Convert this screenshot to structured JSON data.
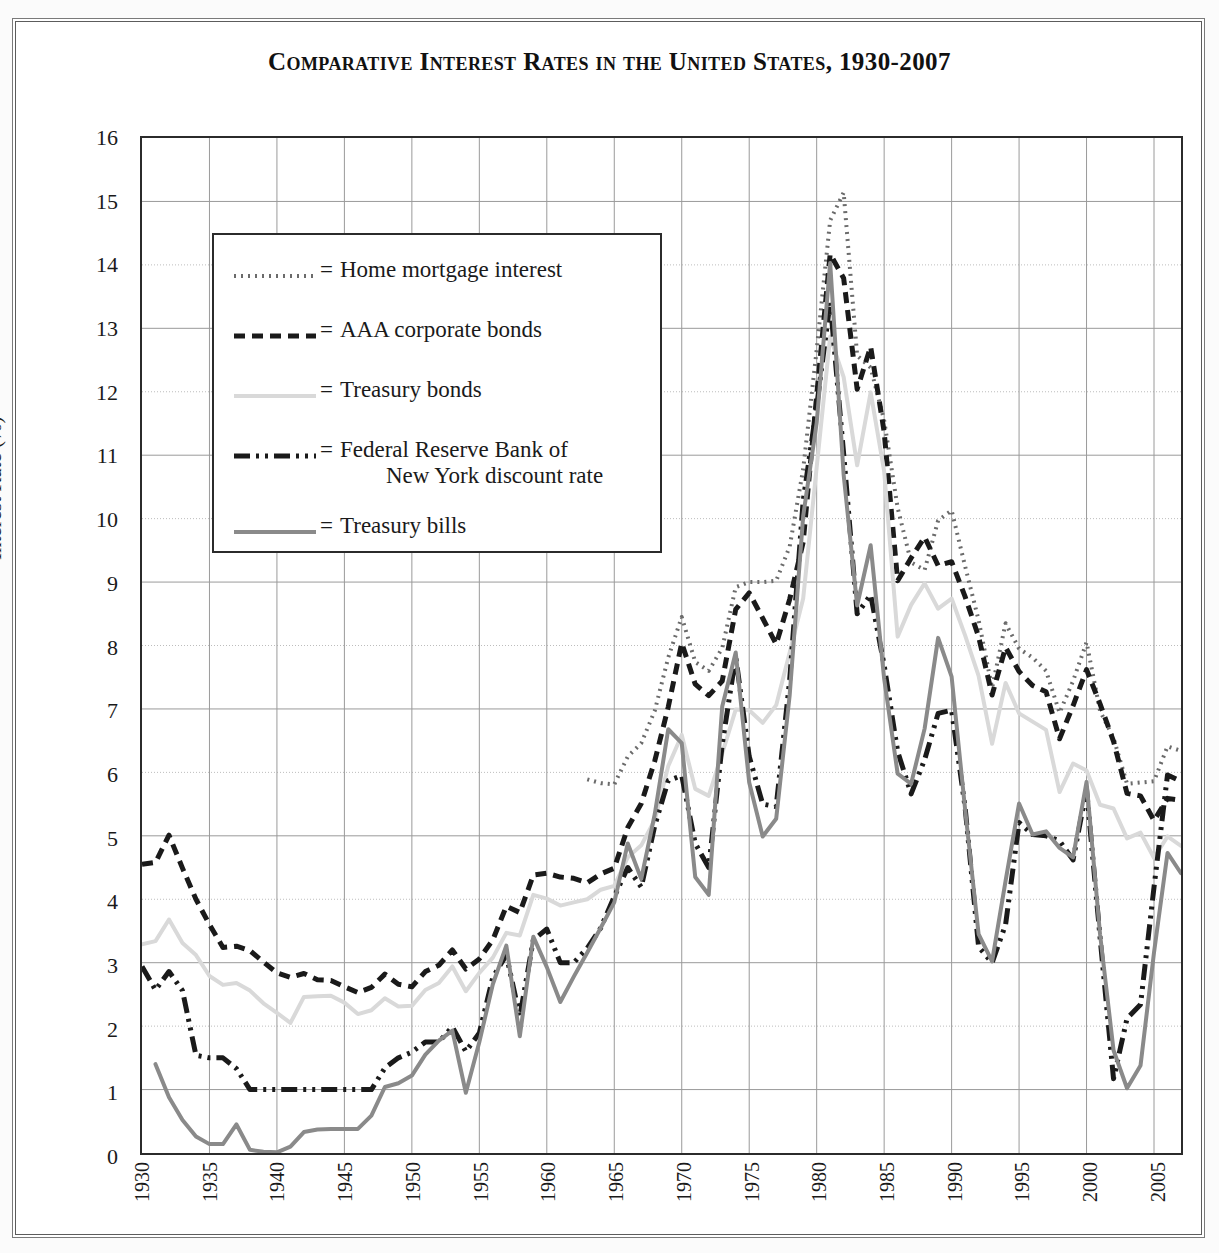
{
  "chart_data": {
    "type": "line",
    "title": "Comparative Interest Rates in the United States, 1930-2007",
    "xlabel": "",
    "ylabel": "Interest Rate (%)",
    "xlim": [
      1930,
      2007
    ],
    "ylim": [
      0,
      16
    ],
    "ytick_step": 1,
    "xtick_step": 5,
    "grid": true,
    "legend_position": "upper-left-inset",
    "x_tick_labels": [
      "1930",
      "1935",
      "1940",
      "1945",
      "1950",
      "1955",
      "1960",
      "1965",
      "1970",
      "1975",
      "1980",
      "1985",
      "1990",
      "1995",
      "2000",
      "2005"
    ],
    "y_tick_labels": [
      "0",
      "1",
      "2",
      "3",
      "4",
      "5",
      "6",
      "7",
      "8",
      "9",
      "10",
      "11",
      "12",
      "13",
      "14",
      "15",
      "16"
    ],
    "x": [
      1930,
      1931,
      1932,
      1933,
      1934,
      1935,
      1936,
      1937,
      1938,
      1939,
      1940,
      1941,
      1942,
      1943,
      1944,
      1945,
      1946,
      1947,
      1948,
      1949,
      1950,
      1951,
      1952,
      1953,
      1954,
      1955,
      1956,
      1957,
      1958,
      1959,
      1960,
      1961,
      1962,
      1963,
      1964,
      1965,
      1966,
      1967,
      1968,
      1969,
      1970,
      1971,
      1972,
      1973,
      1974,
      1975,
      1976,
      1977,
      1978,
      1979,
      1980,
      1981,
      1982,
      1983,
      1984,
      1985,
      1986,
      1987,
      1988,
      1989,
      1990,
      1991,
      1992,
      1993,
      1994,
      1995,
      1996,
      1997,
      1998,
      1999,
      2000,
      2001,
      2002,
      2003,
      2004,
      2005,
      2006,
      2007
    ],
    "series": [
      {
        "name": "Home mortgage interest",
        "style": "dotted",
        "color": "#6b6b6b",
        "x_start": 1963,
        "values": [
          null,
          null,
          null,
          null,
          null,
          null,
          null,
          null,
          null,
          null,
          null,
          null,
          null,
          null,
          null,
          null,
          null,
          null,
          null,
          null,
          null,
          null,
          null,
          null,
          null,
          null,
          null,
          null,
          null,
          null,
          null,
          null,
          null,
          5.89,
          5.83,
          5.81,
          6.25,
          6.46,
          6.97,
          7.81,
          8.45,
          7.74,
          7.6,
          7.96,
          8.92,
          9.0,
          9.0,
          9.02,
          9.56,
          10.78,
          12.66,
          14.7,
          15.14,
          12.57,
          12.38,
          11.55,
          10.17,
          9.31,
          9.19,
          9.97,
          10.13,
          9.25,
          8.4,
          7.33,
          8.35,
          7.95,
          7.81,
          7.6,
          6.94,
          7.44,
          8.05,
          6.97,
          6.54,
          5.82,
          5.84,
          5.86,
          6.41,
          6.34
        ]
      },
      {
        "name": "AAA corporate bonds",
        "style": "dashed",
        "color": "#1a1a1a",
        "values": [
          4.55,
          4.58,
          5.01,
          4.49,
          4.0,
          3.6,
          3.24,
          3.26,
          3.19,
          3.01,
          2.84,
          2.77,
          2.83,
          2.73,
          2.72,
          2.62,
          2.53,
          2.61,
          2.82,
          2.66,
          2.62,
          2.86,
          2.96,
          3.2,
          2.9,
          3.06,
          3.36,
          3.89,
          3.79,
          4.38,
          4.41,
          4.35,
          4.33,
          4.26,
          4.4,
          4.49,
          5.13,
          5.51,
          6.18,
          7.03,
          8.04,
          7.39,
          7.21,
          7.44,
          8.57,
          8.83,
          8.43,
          8.02,
          8.73,
          9.63,
          11.94,
          14.17,
          13.79,
          12.04,
          12.71,
          11.37,
          9.02,
          9.38,
          9.71,
          9.26,
          9.32,
          8.77,
          8.14,
          7.22,
          7.97,
          7.59,
          7.37,
          7.27,
          6.53,
          7.05,
          7.62,
          7.08,
          6.49,
          5.67,
          5.63,
          5.24,
          5.59,
          5.56
        ]
      },
      {
        "name": "Treasury bonds",
        "style": "solid",
        "color": "#d9d9d9",
        "values": [
          3.29,
          3.34,
          3.68,
          3.31,
          3.12,
          2.79,
          2.65,
          2.68,
          2.56,
          2.36,
          2.21,
          2.05,
          2.46,
          2.47,
          2.48,
          2.37,
          2.19,
          2.25,
          2.44,
          2.31,
          2.32,
          2.57,
          2.68,
          2.94,
          2.55,
          2.84,
          3.08,
          3.47,
          3.43,
          4.07,
          4.01,
          3.9,
          3.95,
          4.0,
          4.15,
          4.21,
          4.66,
          4.85,
          5.25,
          6.1,
          6.59,
          5.74,
          5.63,
          6.3,
          6.99,
          6.98,
          6.78,
          7.06,
          7.89,
          8.74,
          10.81,
          12.87,
          12.23,
          10.84,
          11.99,
          10.75,
          8.14,
          8.64,
          8.98,
          8.58,
          8.74,
          8.16,
          7.52,
          6.45,
          7.41,
          6.93,
          6.8,
          6.67,
          5.69,
          6.14,
          6.03,
          5.49,
          5.43,
          4.96,
          5.05,
          4.65,
          4.99,
          4.84
        ]
      },
      {
        "name": "Federal Reserve Bank of New York discount rate",
        "style": "dashdotdot",
        "color": "#1a1a1a",
        "values": [
          2.94,
          2.57,
          2.86,
          2.56,
          1.54,
          1.5,
          1.5,
          1.33,
          1.0,
          1.0,
          1.0,
          1.0,
          1.0,
          1.0,
          1.0,
          1.0,
          1.0,
          1.0,
          1.34,
          1.5,
          1.59,
          1.75,
          1.75,
          1.99,
          1.6,
          1.89,
          2.77,
          3.12,
          2.15,
          3.36,
          3.53,
          3.0,
          3.0,
          3.23,
          3.55,
          4.04,
          4.5,
          4.19,
          5.16,
          5.87,
          5.95,
          4.88,
          4.5,
          6.44,
          7.83,
          6.25,
          5.5,
          5.46,
          7.46,
          10.28,
          11.77,
          13.42,
          11.02,
          8.5,
          8.8,
          7.69,
          6.33,
          5.66,
          6.2,
          6.93,
          6.98,
          5.45,
          3.25,
          3.0,
          3.6,
          5.21,
          5.02,
          5.0,
          4.92,
          4.62,
          5.73,
          3.4,
          1.17,
          2.12,
          2.34,
          4.19,
          5.96,
          5.86
        ]
      },
      {
        "name": "Treasury bills",
        "style": "solid",
        "color": "#8a8a8a",
        "values": [
          null,
          1.4,
          0.88,
          0.52,
          0.26,
          0.14,
          0.14,
          0.45,
          0.05,
          0.02,
          0.01,
          0.1,
          0.33,
          0.37,
          0.38,
          0.38,
          0.38,
          0.59,
          1.04,
          1.1,
          1.22,
          1.55,
          1.77,
          1.93,
          0.95,
          1.75,
          2.66,
          3.27,
          1.84,
          3.41,
          2.93,
          2.38,
          2.78,
          3.16,
          3.55,
          3.95,
          4.88,
          4.32,
          5.34,
          6.68,
          6.46,
          4.35,
          4.07,
          7.04,
          7.89,
          5.84,
          4.99,
          5.27,
          7.22,
          10.04,
          11.51,
          14.03,
          10.69,
          8.63,
          9.58,
          7.48,
          5.98,
          5.82,
          6.69,
          8.12,
          7.51,
          5.42,
          3.45,
          3.02,
          4.29,
          5.51,
          5.02,
          5.07,
          4.81,
          4.66,
          5.85,
          3.45,
          1.62,
          1.02,
          1.38,
          3.16,
          4.73,
          4.41
        ]
      }
    ]
  },
  "legend": {
    "entries": [
      {
        "equals": "=",
        "label": "Home mortgage interest",
        "label2": ""
      },
      {
        "equals": "=",
        "label": "AAA corporate bonds",
        "label2": ""
      },
      {
        "equals": "=",
        "label": "Treasury bonds",
        "label2": ""
      },
      {
        "equals": "=",
        "label": "Federal Reserve Bank of",
        "label2": "New York discount rate"
      },
      {
        "equals": "=",
        "label": "Treasury bills",
        "label2": ""
      }
    ]
  }
}
